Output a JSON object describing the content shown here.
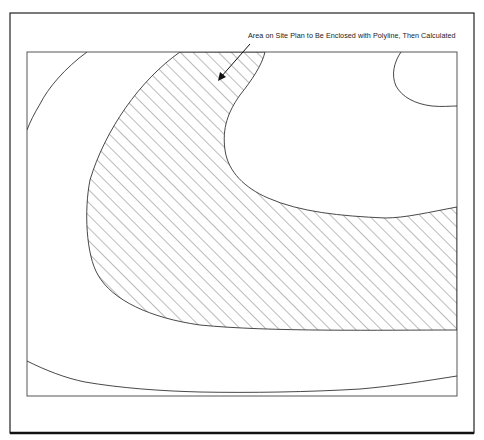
{
  "figure": {
    "type": "site-plan-contour-diagram",
    "callout": {
      "text": "Area on Site Plan to Be Enclosed with Polyline, Then Calculated",
      "arrow_from": [
        250,
        45
      ],
      "arrow_to": [
        219,
        80
      ]
    },
    "frames": {
      "outer": {
        "x": 10,
        "y": 13,
        "width": 464,
        "height": 420
      },
      "inner": {
        "x": 27,
        "y": 52,
        "width": 430,
        "height": 344
      }
    },
    "hatched_region": {
      "description": "Area enclosed by polyline (cross-hatched at 45 degrees)",
      "hatch_spacing_px": 9,
      "hatch_angle_deg": 45
    },
    "contours": [
      {
        "name": "left-contour"
      },
      {
        "name": "top-right-contour"
      },
      {
        "name": "bottom-contour"
      }
    ],
    "colors": {
      "line": "#333333",
      "hatch": "#555555",
      "background": "#ffffff"
    }
  }
}
